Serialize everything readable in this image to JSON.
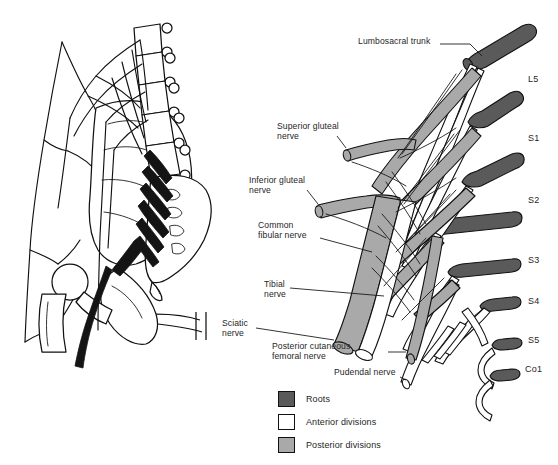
{
  "figure": {
    "title_fragment": "",
    "panels": [
      {
        "id": "left",
        "name": "lateral-pelvis-illustration"
      },
      {
        "id": "right",
        "name": "sacral-plexus-schematic"
      }
    ]
  },
  "colors": {
    "roots": "#5a5a5a",
    "anterior_divisions": "#ffffff",
    "posterior_divisions": "#a9a9a9",
    "outline": "#111111",
    "background": "#ffffff",
    "text": "#262626",
    "bone_fill": "#ffffff",
    "nerve_black": "#141414"
  },
  "legend": {
    "name": "legend",
    "items": [
      {
        "label": "Roots",
        "color": "#5a5a5a"
      },
      {
        "label": "Anterior divisions",
        "color": "#ffffff"
      },
      {
        "label": "Posterior divisions",
        "color": "#a9a9a9"
      }
    ]
  },
  "nerve_labels": [
    {
      "key": "lumbosacral_trunk",
      "text": "Lumbosacral trunk",
      "x": 358,
      "y": 41,
      "align": "left"
    },
    {
      "key": "superior_gluteal",
      "text": "Superior gluteal\nnerve",
      "x": 277,
      "y": 126,
      "align": "left"
    },
    {
      "key": "inferior_gluteal",
      "text": "Inferior gluteal\nnerve",
      "x": 249,
      "y": 180,
      "align": "left"
    },
    {
      "key": "common_fibular",
      "text": "Common\nfibular nerve",
      "x": 258,
      "y": 224,
      "align": "left"
    },
    {
      "key": "tibial",
      "text": "Tibial\nnerve",
      "x": 264,
      "y": 283,
      "align": "left"
    },
    {
      "key": "sciatic",
      "text": "Sciatic\nnerve",
      "x": 222,
      "y": 323,
      "align": "left"
    },
    {
      "key": "posterior_cutaneous_femoral",
      "text": "Posterior cutaneous\nfemoral nerve",
      "x": 272,
      "y": 345,
      "align": "left"
    },
    {
      "key": "pudendal",
      "text": "Pudendal nerve",
      "x": 334,
      "y": 371,
      "align": "left"
    }
  ],
  "root_labels": [
    {
      "key": "L5",
      "text": "L5",
      "x": 528,
      "y": 79
    },
    {
      "key": "S1",
      "text": "S1",
      "x": 528,
      "y": 138
    },
    {
      "key": "S2",
      "text": "S2",
      "x": 528,
      "y": 200
    },
    {
      "key": "S3",
      "text": "S3",
      "x": 528,
      "y": 260
    },
    {
      "key": "S4",
      "text": "S4",
      "x": 528,
      "y": 301
    },
    {
      "key": "S5",
      "text": "S5",
      "x": 528,
      "y": 340
    },
    {
      "key": "Co1",
      "text": "Co1",
      "x": 525,
      "y": 369
    }
  ]
}
